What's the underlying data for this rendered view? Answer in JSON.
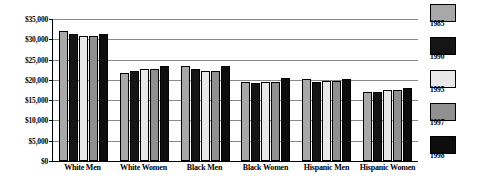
{
  "chart_data": {
    "type": "bar",
    "title": "",
    "xlabel": "",
    "ylabel": "",
    "ylim": [
      0,
      35000
    ],
    "grid": true,
    "legend_position": "right",
    "categories": [
      "White Men",
      "White Women",
      "Black Men",
      "Black Women",
      "Hispanic Men",
      "Hispanic Women"
    ],
    "ytick_labels": [
      "$35,000",
      "$30,000",
      "$25,000",
      "$20,000",
      "$15,000",
      "$10,000",
      "$5,000",
      "$0"
    ],
    "ytick_values": [
      35000,
      30000,
      25000,
      20000,
      15000,
      10000,
      5000,
      0
    ],
    "series": [
      {
        "name": "1985",
        "color": "#a8a8a8",
        "values": [
          32000,
          21700,
          23500,
          19500,
          20200,
          17100
        ]
      },
      {
        "name": "1990",
        "color": "#151515",
        "values": [
          31300,
          22300,
          22700,
          19300,
          19500,
          17000
        ]
      },
      {
        "name": "1995",
        "color": "#e8e8e8",
        "values": [
          30900,
          22700,
          22300,
          19500,
          19600,
          17600
        ]
      },
      {
        "name": "1997",
        "color": "#909090",
        "values": [
          30900,
          22700,
          22300,
          19500,
          19600,
          17600
        ]
      },
      {
        "name": "1998",
        "color": "#0d0d0d",
        "values": [
          31400,
          23500,
          23400,
          20400,
          20100,
          18000
        ]
      }
    ]
  },
  "legend": {
    "items": [
      {
        "label": "1985",
        "color": "#a8a8a8"
      },
      {
        "label": "1990",
        "color": "#151515"
      },
      {
        "label": "1995",
        "color": "#e8e8e8"
      },
      {
        "label": "1997",
        "color": "#909090"
      },
      {
        "label": "1998",
        "color": "#0d0d0d"
      }
    ]
  }
}
